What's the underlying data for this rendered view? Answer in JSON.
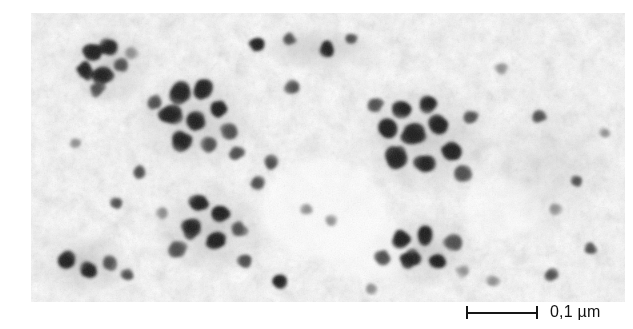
{
  "figure": {
    "kind": "transmission-electron-micrograph",
    "caption_text": "",
    "background_color": "#ffffff"
  },
  "micrograph": {
    "alt_text": "Transmission electron micrograph showing dark electron-dense particle clusters on a mottled light grey background",
    "plate": {
      "x": 31,
      "y": 13,
      "width": 594,
      "height": 289
    },
    "tone": {
      "paper": "#fdfdfd",
      "haze": "#e7e7e7",
      "mid_grain": "#b9b9b9",
      "particle_dark": "#1b1b1b",
      "particle_mid": "#4a4a4a",
      "particle_soft": "#8a8a8a"
    },
    "regions": [
      {
        "name": "upper-left-rosette",
        "cx": 78,
        "cy": 52,
        "r": 42
      },
      {
        "name": "central-left-rosette",
        "cx": 160,
        "cy": 110,
        "r": 55
      },
      {
        "name": "lower-left-cluster",
        "cx": 175,
        "cy": 215,
        "r": 50
      },
      {
        "name": "bottom-left-chain",
        "cx": 55,
        "cy": 252,
        "r": 38
      },
      {
        "name": "upper-right-rosette",
        "cx": 395,
        "cy": 130,
        "r": 62
      },
      {
        "name": "lower-right-rosette",
        "cx": 395,
        "cy": 240,
        "r": 45
      },
      {
        "name": "sparse-centre",
        "cx": 265,
        "cy": 180,
        "r": 60
      }
    ],
    "clusters": [
      {
        "cx": 62,
        "cy": 40,
        "r": 9,
        "tone": "dark"
      },
      {
        "cx": 78,
        "cy": 34,
        "r": 8,
        "tone": "dark"
      },
      {
        "cx": 54,
        "cy": 58,
        "r": 8,
        "tone": "dark"
      },
      {
        "cx": 72,
        "cy": 62,
        "r": 9,
        "tone": "dark"
      },
      {
        "cx": 90,
        "cy": 52,
        "r": 7,
        "tone": "mid"
      },
      {
        "cx": 66,
        "cy": 76,
        "r": 7,
        "tone": "mid"
      },
      {
        "cx": 100,
        "cy": 40,
        "r": 6,
        "tone": "soft"
      },
      {
        "cx": 150,
        "cy": 80,
        "r": 10,
        "tone": "dark"
      },
      {
        "cx": 172,
        "cy": 76,
        "r": 9,
        "tone": "dark"
      },
      {
        "cx": 140,
        "cy": 102,
        "r": 10,
        "tone": "dark"
      },
      {
        "cx": 164,
        "cy": 108,
        "r": 9,
        "tone": "dark"
      },
      {
        "cx": 188,
        "cy": 96,
        "r": 8,
        "tone": "dark"
      },
      {
        "cx": 152,
        "cy": 128,
        "r": 10,
        "tone": "dark"
      },
      {
        "cx": 178,
        "cy": 132,
        "r": 8,
        "tone": "mid"
      },
      {
        "cx": 198,
        "cy": 118,
        "r": 8,
        "tone": "mid"
      },
      {
        "cx": 206,
        "cy": 140,
        "r": 7,
        "tone": "mid"
      },
      {
        "cx": 124,
        "cy": 90,
        "r": 7,
        "tone": "mid"
      },
      {
        "cx": 168,
        "cy": 190,
        "r": 9,
        "tone": "dark"
      },
      {
        "cx": 190,
        "cy": 200,
        "r": 8,
        "tone": "dark"
      },
      {
        "cx": 160,
        "cy": 215,
        "r": 9,
        "tone": "dark"
      },
      {
        "cx": 186,
        "cy": 228,
        "r": 9,
        "tone": "dark"
      },
      {
        "cx": 208,
        "cy": 216,
        "r": 8,
        "tone": "mid"
      },
      {
        "cx": 146,
        "cy": 236,
        "r": 8,
        "tone": "mid"
      },
      {
        "cx": 214,
        "cy": 248,
        "r": 7,
        "tone": "mid"
      },
      {
        "cx": 132,
        "cy": 200,
        "r": 6,
        "tone": "soft"
      },
      {
        "cx": 36,
        "cy": 248,
        "r": 8,
        "tone": "dark"
      },
      {
        "cx": 58,
        "cy": 258,
        "r": 8,
        "tone": "dark"
      },
      {
        "cx": 78,
        "cy": 250,
        "r": 7,
        "tone": "mid"
      },
      {
        "cx": 96,
        "cy": 262,
        "r": 6,
        "tone": "mid"
      },
      {
        "cx": 372,
        "cy": 96,
        "r": 10,
        "tone": "dark"
      },
      {
        "cx": 398,
        "cy": 90,
        "r": 9,
        "tone": "dark"
      },
      {
        "cx": 356,
        "cy": 116,
        "r": 10,
        "tone": "dark"
      },
      {
        "cx": 382,
        "cy": 122,
        "r": 11,
        "tone": "dark"
      },
      {
        "cx": 408,
        "cy": 112,
        "r": 9,
        "tone": "dark"
      },
      {
        "cx": 366,
        "cy": 144,
        "r": 10,
        "tone": "dark"
      },
      {
        "cx": 394,
        "cy": 150,
        "r": 9,
        "tone": "dark"
      },
      {
        "cx": 420,
        "cy": 138,
        "r": 9,
        "tone": "dark"
      },
      {
        "cx": 432,
        "cy": 160,
        "r": 8,
        "tone": "mid"
      },
      {
        "cx": 344,
        "cy": 92,
        "r": 7,
        "tone": "mid"
      },
      {
        "cx": 440,
        "cy": 104,
        "r": 7,
        "tone": "mid"
      },
      {
        "cx": 370,
        "cy": 226,
        "r": 9,
        "tone": "dark"
      },
      {
        "cx": 394,
        "cy": 222,
        "r": 9,
        "tone": "dark"
      },
      {
        "cx": 380,
        "cy": 246,
        "r": 9,
        "tone": "dark"
      },
      {
        "cx": 406,
        "cy": 248,
        "r": 8,
        "tone": "dark"
      },
      {
        "cx": 422,
        "cy": 230,
        "r": 8,
        "tone": "mid"
      },
      {
        "cx": 352,
        "cy": 244,
        "r": 7,
        "tone": "mid"
      },
      {
        "cx": 432,
        "cy": 258,
        "r": 6,
        "tone": "soft"
      },
      {
        "cx": 226,
        "cy": 32,
        "r": 7,
        "tone": "dark"
      },
      {
        "cx": 258,
        "cy": 26,
        "r": 6,
        "tone": "mid"
      },
      {
        "cx": 296,
        "cy": 36,
        "r": 7,
        "tone": "dark"
      },
      {
        "cx": 320,
        "cy": 26,
        "r": 6,
        "tone": "mid"
      },
      {
        "cx": 262,
        "cy": 74,
        "r": 7,
        "tone": "mid"
      },
      {
        "cx": 240,
        "cy": 150,
        "r": 7,
        "tone": "mid"
      },
      {
        "cx": 226,
        "cy": 170,
        "r": 7,
        "tone": "mid"
      },
      {
        "cx": 276,
        "cy": 196,
        "r": 6,
        "tone": "soft"
      },
      {
        "cx": 248,
        "cy": 268,
        "r": 7,
        "tone": "dark"
      },
      {
        "cx": 300,
        "cy": 208,
        "r": 6,
        "tone": "soft"
      },
      {
        "cx": 470,
        "cy": 56,
        "r": 6,
        "tone": "soft"
      },
      {
        "cx": 508,
        "cy": 104,
        "r": 6,
        "tone": "mid"
      },
      {
        "cx": 546,
        "cy": 168,
        "r": 6,
        "tone": "mid"
      },
      {
        "cx": 524,
        "cy": 196,
        "r": 6,
        "tone": "soft"
      },
      {
        "cx": 560,
        "cy": 236,
        "r": 6,
        "tone": "mid"
      },
      {
        "cx": 520,
        "cy": 262,
        "r": 6,
        "tone": "mid"
      },
      {
        "cx": 462,
        "cy": 268,
        "r": 6,
        "tone": "soft"
      },
      {
        "cx": 574,
        "cy": 120,
        "r": 5,
        "tone": "soft"
      },
      {
        "cx": 340,
        "cy": 276,
        "r": 6,
        "tone": "soft"
      },
      {
        "cx": 108,
        "cy": 160,
        "r": 6,
        "tone": "mid"
      },
      {
        "cx": 44,
        "cy": 130,
        "r": 5,
        "tone": "soft"
      },
      {
        "cx": 86,
        "cy": 190,
        "r": 6,
        "tone": "mid"
      }
    ]
  },
  "scalebar": {
    "name": "scale-bar",
    "label": "0,1 µm",
    "value": "0,1",
    "unit": "µm",
    "bar_length_px": 72,
    "bar_color": "#161616",
    "has_end_caps": true
  }
}
